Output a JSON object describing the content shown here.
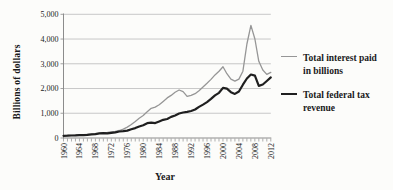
{
  "figure": {
    "background": "#fcfcfa",
    "y_axis_title": "Billions of dollars",
    "x_axis_title": "Year"
  },
  "colors": {
    "grid": "#c2c2c2",
    "axis": "#8c8c8c",
    "text": "#1a1a1a",
    "series_interest": "#969696",
    "series_revenue": "#1f1f1f"
  },
  "chart_data": {
    "type": "line",
    "title": "",
    "xlabel": "Year",
    "ylabel": "Billions of dollars",
    "xlim": [
      1960,
      2012
    ],
    "ylim": [
      0,
      5000
    ],
    "grid": "horizontal",
    "legend_position": "right",
    "y_tick_values": [
      0,
      1000,
      2000,
      3000,
      4000,
      5000
    ],
    "y_tick_labels": [
      "0",
      "1,000",
      "2,000",
      "3,000",
      "4,000",
      "5,000"
    ],
    "x_tick_step_minor": 1,
    "x_tick_labels": [
      "1960",
      "1964",
      "1968",
      "1972",
      "1976",
      "1980",
      "1984",
      "1988",
      "1992",
      "1996",
      "2000",
      "2004",
      "2008",
      "2012"
    ],
    "x": [
      1960,
      1961,
      1962,
      1963,
      1964,
      1965,
      1966,
      1967,
      1968,
      1969,
      1970,
      1971,
      1972,
      1973,
      1974,
      1975,
      1976,
      1977,
      1978,
      1979,
      1980,
      1981,
      1982,
      1983,
      1984,
      1985,
      1986,
      1987,
      1988,
      1989,
      1990,
      1991,
      1992,
      1993,
      1994,
      1995,
      1996,
      1997,
      1998,
      1999,
      2000,
      2001,
      2002,
      2003,
      2004,
      2005,
      2006,
      2007,
      2008,
      2009,
      2010,
      2011,
      2012
    ],
    "series": [
      {
        "name": "Total interest paid in billions",
        "color": "#969696",
        "width": 1.3,
        "values": [
          95,
          100,
          106,
          113,
          122,
          132,
          144,
          157,
          172,
          188,
          205,
          222,
          242,
          268,
          305,
          360,
          440,
          545,
          670,
          800,
          910,
          1060,
          1200,
          1250,
          1340,
          1480,
          1620,
          1720,
          1850,
          1940,
          1870,
          1680,
          1720,
          1790,
          1910,
          2060,
          2210,
          2370,
          2550,
          2700,
          2880,
          2600,
          2380,
          2300,
          2380,
          2700,
          3800,
          4550,
          4000,
          3100,
          2750,
          2570,
          2650
        ]
      },
      {
        "name": "Total federal tax revenue",
        "color": "#1f1f1f",
        "width": 2.2,
        "values": [
          90,
          94,
          100,
          106,
          113,
          117,
          131,
          149,
          153,
          187,
          193,
          187,
          207,
          231,
          263,
          279,
          298,
          356,
          400,
          463,
          517,
          599,
          618,
          601,
          666,
          734,
          769,
          854,
          909,
          991,
          1032,
          1055,
          1091,
          1154,
          1259,
          1352,
          1453,
          1579,
          1722,
          1827,
          2025,
          1991,
          1853,
          1782,
          1880,
          2154,
          2407,
          2568,
          2524,
          2105,
          2163,
          2304,
          2450
        ]
      }
    ]
  }
}
